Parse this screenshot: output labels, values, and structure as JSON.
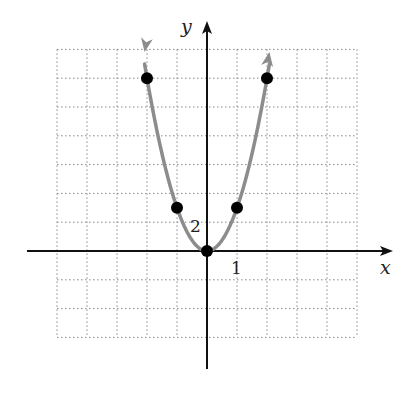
{
  "chart_data": {
    "type": "line",
    "title": "",
    "function": "y = 3x^2",
    "xlabel": "x",
    "ylabel": "y",
    "x_tick_label": "1",
    "y_tick_label": "2",
    "x_scale_per_grid": 1,
    "y_scale_per_grid": 2,
    "xlim": [
      -5,
      5
    ],
    "ylim": [
      -6,
      14
    ],
    "grid": true,
    "grid_style": "dotted",
    "points": [
      {
        "x": -2,
        "y": 12
      },
      {
        "x": -1,
        "y": 3
      },
      {
        "x": 0,
        "y": 0
      },
      {
        "x": 1,
        "y": 3
      },
      {
        "x": 2,
        "y": 12
      }
    ],
    "series": [
      {
        "name": "parabola",
        "color": "#8c8c8c",
        "x": [
          -2,
          -1,
          0,
          1,
          2
        ],
        "values": [
          12,
          3,
          0,
          3,
          12
        ]
      }
    ],
    "colors": {
      "curve": "#8c8c8c",
      "axis": "#111111",
      "grid": "#888888",
      "points": "#000000"
    }
  },
  "labels": {
    "x_axis": "x",
    "y_axis": "y",
    "x_tick": "1",
    "y_tick": "2"
  }
}
